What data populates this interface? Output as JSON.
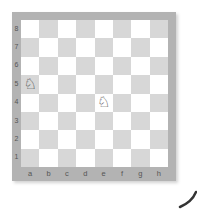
{
  "board": {
    "files": [
      "a",
      "b",
      "c",
      "d",
      "e",
      "f",
      "g",
      "h"
    ],
    "ranks": [
      "8",
      "7",
      "6",
      "5",
      "4",
      "3",
      "2",
      "1"
    ],
    "colors": {
      "frame": "#b3b3b3",
      "light_square": "#ffffff",
      "dark_square": "#d7d7d7",
      "label": "#555555"
    },
    "pieces": [
      {
        "square": "a5",
        "type": "knight",
        "color": "white",
        "glyph": "♘",
        "icon": "white-knight-icon"
      },
      {
        "square": "e4",
        "type": "knight",
        "color": "white",
        "glyph": "♘",
        "icon": "white-knight-icon"
      }
    ]
  }
}
